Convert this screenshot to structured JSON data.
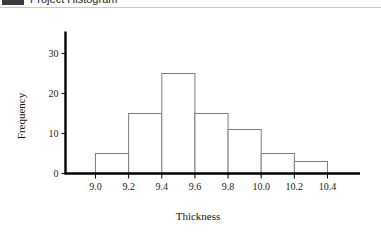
{
  "window": {
    "title": "Project Histogram",
    "icon": "app-icon"
  },
  "chart_data": {
    "type": "bar",
    "title": "",
    "subtitle": "",
    "xlabel": "Thickness",
    "ylabel": "Frequency",
    "grid": false,
    "legend": "none",
    "bin_edges": [
      9.0,
      9.2,
      9.4,
      9.6,
      9.8,
      10.0,
      10.2,
      10.4
    ],
    "categories": [
      "9.0-9.2",
      "9.2-9.4",
      "9.4-9.6",
      "9.6-9.8",
      "9.8-10.0",
      "10.0-10.2",
      "10.2-10.4"
    ],
    "values": [
      5,
      15,
      25,
      15,
      11,
      5,
      3
    ],
    "xticks": [
      "9.0",
      "9.2",
      "9.4",
      "9.6",
      "9.8",
      "10.0",
      "10.2",
      "10.4"
    ],
    "xtick_values": [
      9.0,
      9.2,
      9.4,
      9.6,
      9.8,
      10.0,
      10.2,
      10.4
    ],
    "yticks": [
      "0",
      "10",
      "20",
      "30"
    ],
    "ytick_values": [
      0,
      10,
      20,
      30
    ],
    "xlim": [
      8.88,
      10.55
    ],
    "ylim": [
      0,
      34
    ],
    "bar_fill": "#ffffff",
    "bar_stroke": "#7d7d7d",
    "axis_color": "#000000"
  }
}
